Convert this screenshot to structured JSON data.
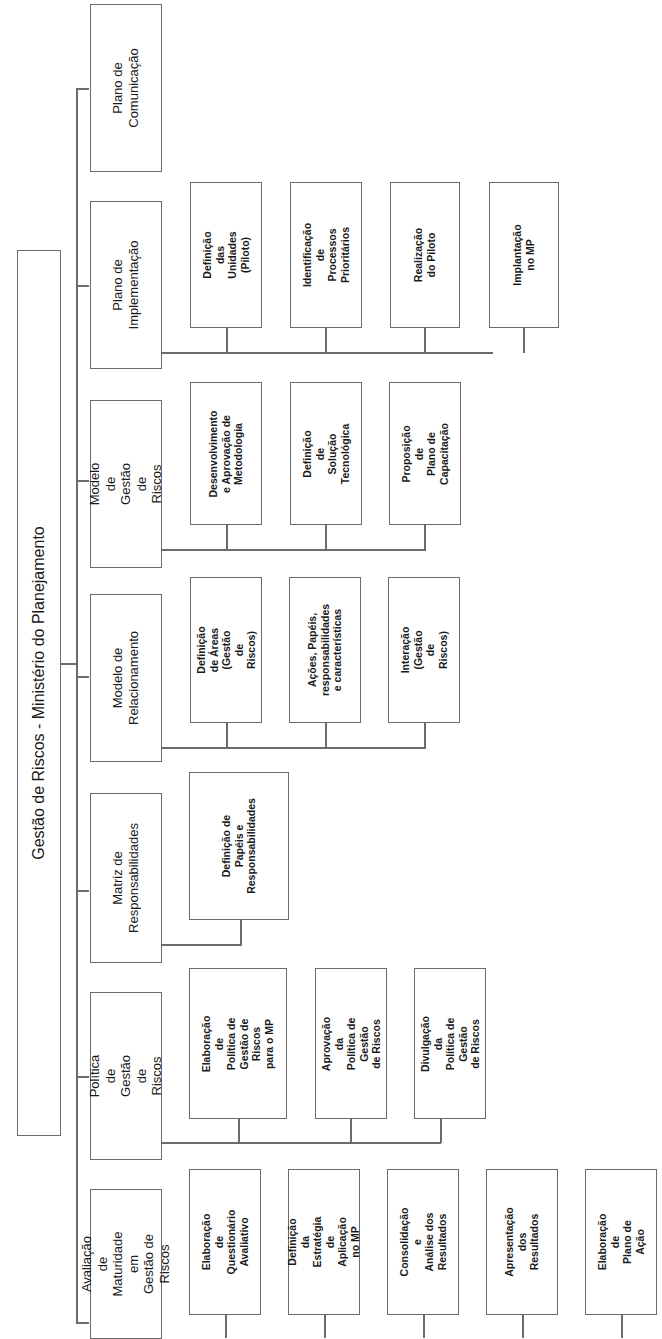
{
  "diagram": {
    "orientation": "rotated-90-ccw",
    "line_color": "#6b6b6b",
    "root": {
      "label": "Gestão de Riscos - Ministério do Planejamento"
    },
    "branches": [
      {
        "label": "Plano de\nComunicação",
        "children": []
      },
      {
        "label": "Plano de\nImplementação",
        "children": [
          "Definição das\nUnidades (Piloto)",
          "Identificação de\nProcessos\nPrioritários",
          "Realização\ndo Piloto",
          "Implantação\nno MP"
        ]
      },
      {
        "label": "Modelo de\nGestão de Riscos",
        "children": [
          "Desenvolvimento\ne Aprovação de\nMetodologia",
          "Definição de\nSolução\nTecnológica",
          "Proposição de\nPlano de\nCapacitação"
        ]
      },
      {
        "label": "Modelo de\nRelacionamento",
        "children": [
          "Definição de Áreas\n(Gestão de Riscos)",
          "Ações, Papéis,\nresponsabilidades\ne características",
          "Interação\n(Gestão de Riscos)"
        ]
      },
      {
        "label": "Matriz de\nResponsabilidades",
        "children": [
          "Definição de\nPapéis e\nResponsabilidades"
        ]
      },
      {
        "label": "Política de Gestão\nde Riscos",
        "children": [
          "Elaboração de\nPolítica de\nGestão de Riscos\npara o MP",
          "Aprovação da\nPolítica de Gestão\nde Riscos",
          "Divulgação da\nPolítica de Gestão\nde Riscos"
        ]
      },
      {
        "label": "Avaliação de\nMaturidade em\nGestão de Riscos",
        "children": [
          "Elaboração de\nQuestionário\nAvaliativo",
          "Definição da\nEstratégia de\nAplicação  no MP",
          "Consolidação e\nAnálise dos\nResultados",
          "Apresentação dos\nResultados",
          "Elaboração de\nPlano de Ação"
        ]
      }
    ]
  }
}
